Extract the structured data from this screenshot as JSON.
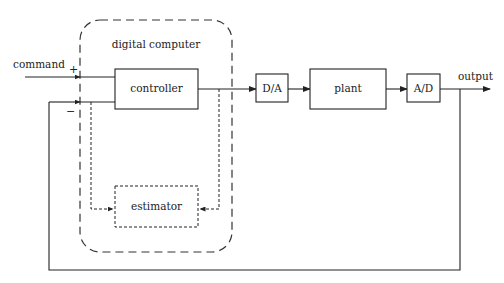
{
  "diagram": {
    "type": "block-diagram",
    "container": {
      "label": "digital computer",
      "style": "dashed-rounded"
    },
    "blocks": {
      "controller": {
        "label": "controller"
      },
      "estimator": {
        "label": "estimator",
        "style": "dotted"
      },
      "dac": {
        "label": "D/A"
      },
      "plant": {
        "label": "plant"
      },
      "adc": {
        "label": "A/D"
      }
    },
    "signals": {
      "input": {
        "label": "command"
      },
      "output": {
        "label": "output"
      }
    },
    "summing_signs": {
      "plus": "+",
      "minus": "−"
    },
    "connections": [
      {
        "from": "command",
        "to": "controller",
        "sign": "+"
      },
      {
        "from": "output-feedback",
        "to": "controller",
        "sign": "−"
      },
      {
        "from": "controller",
        "to": "dac"
      },
      {
        "from": "dac",
        "to": "plant"
      },
      {
        "from": "plant",
        "to": "adc"
      },
      {
        "from": "adc",
        "to": "output"
      },
      {
        "from": "feedback-line",
        "to": "estimator",
        "style": "dotted"
      },
      {
        "from": "controller-output",
        "to": "estimator",
        "style": "dotted"
      }
    ],
    "colors": {
      "line": "#222222",
      "background": "#ffffff"
    }
  }
}
